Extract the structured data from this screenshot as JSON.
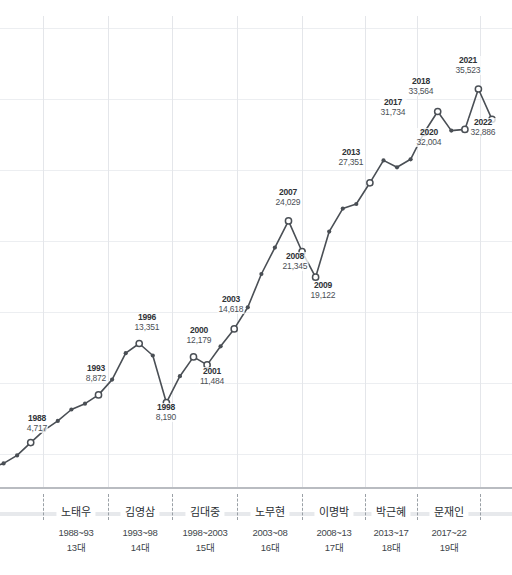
{
  "header": {
    "clipped_text": ""
  },
  "chart_data": {
    "type": "line",
    "title": "",
    "subtitle": "",
    "xlabel": "",
    "ylabel": "",
    "grid": true,
    "legend": "none",
    "xlim": [
      1985,
      2022
    ],
    "ylim": [
      0,
      38000
    ],
    "x": [
      1985,
      1986,
      1987,
      1988,
      1989,
      1990,
      1991,
      1992,
      1993,
      1994,
      1995,
      1996,
      1997,
      1998,
      1999,
      2000,
      2001,
      2002,
      2003,
      2004,
      2005,
      2006,
      2007,
      2008,
      2009,
      2010,
      2011,
      2012,
      2013,
      2014,
      2015,
      2016,
      2017,
      2018,
      2019,
      2020,
      2021,
      2022
    ],
    "values": [
      2500,
      2900,
      3600,
      4717,
      5800,
      6600,
      7600,
      8100,
      8872,
      10200,
      12500,
      13351,
      12300,
      8190,
      10500,
      12179,
      11484,
      13100,
      14618,
      16500,
      19400,
      21700,
      24029,
      21345,
      19122,
      23100,
      25100,
      25500,
      27351,
      29300,
      28700,
      29400,
      31734,
      33564,
      31900,
      32004,
      35523,
      32886
    ],
    "labeled_points": [
      {
        "year": "1988",
        "value": "4,717",
        "x": 43,
        "y": 437,
        "lx": 37,
        "ly": 398
      },
      {
        "year": "1993",
        "value": "8,872",
        "x": 108,
        "y": 368,
        "lx": 96,
        "ly": 348
      },
      {
        "year": "1996",
        "value": "13,351",
        "x": 146,
        "y": 330,
        "lx": 147,
        "ly": 297
      },
      {
        "year": "1998",
        "value": "8,190",
        "x": 172,
        "y": 387,
        "lx": 166,
        "ly": 387
      },
      {
        "year": "2000",
        "value": "12,179",
        "x": 198,
        "y": 341,
        "lx": 199,
        "ly": 310
      },
      {
        "year": "2001",
        "value": "11,484",
        "x": 211,
        "y": 349,
        "lx": 212,
        "ly": 351
      },
      {
        "year": "2003",
        "value": "14,618",
        "x": 237,
        "y": 312,
        "lx": 231,
        "ly": 279
      },
      {
        "year": "2007",
        "value": "24,029",
        "x": 289,
        "y": 203,
        "lx": 288,
        "ly": 172
      },
      {
        "year": "2008",
        "value": "21,345",
        "x": 302,
        "y": 234,
        "lx": 295,
        "ly": 236
      },
      {
        "year": "2009",
        "value": "19,122",
        "x": 315,
        "y": 263,
        "lx": 323,
        "ly": 265
      },
      {
        "year": "2013",
        "value": "27,351",
        "x": 365,
        "y": 163,
        "lx": 351,
        "ly": 132
      },
      {
        "year": "2017",
        "value": "31,734",
        "x": 417,
        "y": 114,
        "lx": 393,
        "ly": 82
      },
      {
        "year": "2018",
        "value": "33,564",
        "x": 430,
        "y": 94,
        "lx": 421,
        "ly": 61
      },
      {
        "year": "2020",
        "value": "32,004",
        "x": 455,
        "y": 113,
        "lx": 429,
        "ly": 112
      },
      {
        "year": "2021",
        "value": "35,523",
        "x": 468,
        "y": 73,
        "lx": 468,
        "ly": 40
      },
      {
        "year": "2022",
        "value": "32,886",
        "x": 481,
        "y": 103,
        "lx": 483,
        "ly": 102
      }
    ],
    "vertical_gridlines_x": [
      43,
      108,
      172,
      237,
      302,
      365,
      417,
      480
    ],
    "horizontal_gridlines_y": [
      12,
      83,
      154,
      225,
      296,
      367,
      438
    ],
    "line_color": "#4a4f55",
    "grid_color": "#e4e6ea"
  },
  "presidents": {
    "axis_name": "대통령 임기",
    "items": [
      {
        "name": "노태우",
        "years": "1988~93",
        "term": "13대",
        "cx": 76,
        "divider_x": 43
      },
      {
        "name": "김영삼",
        "years": "1993~98",
        "term": "14대",
        "cx": 140,
        "divider_x": 108
      },
      {
        "name": "김대중",
        "years": "1998~2003",
        "term": "15대",
        "cx": 205,
        "divider_x": 172
      },
      {
        "name": "노무현",
        "years": "2003~08",
        "term": "16대",
        "cx": 270,
        "divider_x": 237
      },
      {
        "name": "이명박",
        "years": "2008~13",
        "term": "17대",
        "cx": 334,
        "divider_x": 302
      },
      {
        "name": "박근혜",
        "years": "2013~17",
        "term": "18대",
        "cx": 391,
        "divider_x": 365
      },
      {
        "name": "문재인",
        "years": "2017~22",
        "term": "19대",
        "cx": 449,
        "divider_x": 417
      }
    ],
    "last_divider_x": 480
  }
}
